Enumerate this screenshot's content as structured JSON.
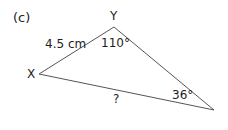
{
  "part_label": "(c)",
  "vertices": {
    "X": {
      "label": "X",
      "x": 39,
      "y": 74
    },
    "Y": {
      "label": "Y",
      "x": 114,
      "y": 27
    },
    "Z": {
      "label": "",
      "x": 214,
      "y": 110
    }
  },
  "side_xy": "4.5 cm",
  "side_xz": "?",
  "angle_y": "110°",
  "angle_z": "36°",
  "line_color": "#555555"
}
